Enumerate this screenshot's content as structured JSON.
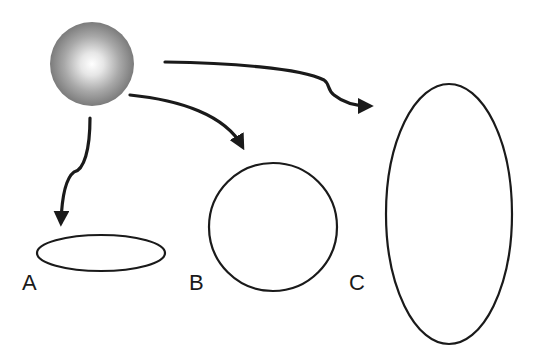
{
  "diagram": {
    "title": "",
    "colors": {
      "stroke": "#1a1a1a",
      "sphere_light": "#ffffff",
      "sphere_mid": "#a8a8a8",
      "sphere_dark": "#6e6e6e",
      "background": "#ffffff"
    },
    "source": {
      "shape": "shaded-sphere",
      "cx": 92,
      "cy": 64,
      "r": 42
    },
    "targets": [
      {
        "id": "A",
        "label": "A",
        "shape": "flat-ellipse",
        "cx": 101,
        "cy": 253,
        "rx": 64,
        "ry": 18,
        "label_x": 22,
        "label_y": 272
      },
      {
        "id": "B",
        "label": "B",
        "shape": "circle",
        "cx": 273,
        "cy": 227,
        "r": 64,
        "label_x": 189,
        "label_y": 272
      },
      {
        "id": "C",
        "label": "C",
        "shape": "tall-ellipse",
        "cx": 449,
        "cy": 214,
        "rx": 63,
        "ry": 130,
        "label_x": 349,
        "label_y": 272
      }
    ],
    "arrows": [
      {
        "from": "source",
        "to": "A"
      },
      {
        "from": "source",
        "to": "B"
      },
      {
        "from": "source",
        "to": "C"
      }
    ]
  }
}
